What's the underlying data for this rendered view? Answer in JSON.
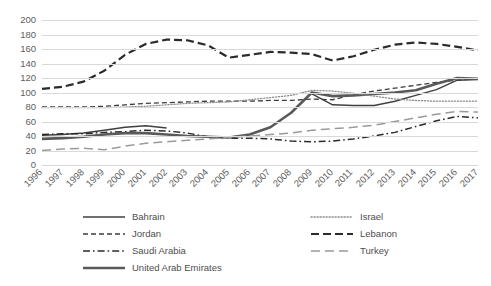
{
  "chart_data": {
    "type": "line",
    "title": "",
    "xlabel": "",
    "ylabel": "",
    "ylim": [
      0,
      200
    ],
    "ytick_step": 20,
    "grid": true,
    "legend_position": "bottom",
    "yticks": [
      "200",
      "180",
      "160",
      "140",
      "120",
      "100",
      "80",
      "60",
      "40",
      "20",
      "0"
    ],
    "categories": [
      "1996",
      "1997",
      "1998",
      "1999",
      "2000",
      "2001",
      "2002",
      "2003",
      "2004",
      "2005",
      "2006",
      "2007",
      "2008",
      "2009",
      "2010",
      "2011",
      "2012",
      "2013",
      "2014",
      "2015",
      "2016",
      "2017"
    ],
    "series": [
      {
        "name": "Bahrain",
        "style": "solid-thin",
        "color": "#404040",
        "values": [
          41,
          42,
          44,
          48,
          52,
          54,
          51,
          null,
          null,
          null,
          null,
          null,
          null,
          98,
          83,
          82,
          82,
          88,
          96,
          104,
          117,
          118
        ]
      },
      {
        "name": "Jordan",
        "style": "dashed",
        "color": "#3d3d3d",
        "values": [
          80,
          80,
          80,
          81,
          83,
          85,
          86,
          87,
          88,
          88,
          88,
          89,
          89,
          91,
          90,
          97,
          102,
          106,
          110,
          114,
          117,
          119
        ]
      },
      {
        "name": "Saudi Arabia",
        "style": "dash-dot",
        "color": "#2b2b2b",
        "values": [
          42,
          43,
          43,
          45,
          46,
          48,
          47,
          44,
          39,
          37,
          37,
          36,
          33,
          32,
          33,
          36,
          40,
          45,
          53,
          61,
          67,
          65
        ]
      },
      {
        "name": "United Arab Emirates",
        "style": "solid-thick",
        "color": "#595959",
        "values": [
          36,
          37,
          39,
          42,
          44,
          44,
          42,
          40,
          39,
          38,
          42,
          52,
          72,
          100,
          95,
          96,
          98,
          100,
          103,
          112,
          120,
          119
        ]
      },
      {
        "name": "Israel",
        "style": "dotted",
        "color": "#8c8c8c",
        "values": [
          79,
          79,
          79,
          79,
          80,
          81,
          83,
          85,
          86,
          87,
          90,
          93,
          96,
          103,
          102,
          99,
          95,
          91,
          89,
          88,
          88,
          88
        ]
      },
      {
        "name": "Lebanon",
        "style": "long-dash-bold",
        "color": "#2b2b2b",
        "values": [
          105,
          108,
          115,
          130,
          152,
          167,
          173,
          172,
          165,
          148,
          152,
          156,
          155,
          153,
          144,
          150,
          159,
          166,
          169,
          167,
          163,
          158
        ]
      },
      {
        "name": "Turkey",
        "style": "long-dash-gray",
        "color": "#9a9a9a",
        "values": [
          20,
          22,
          23,
          21,
          26,
          30,
          32,
          34,
          36,
          38,
          40,
          42,
          44,
          48,
          50,
          52,
          55,
          60,
          65,
          70,
          74,
          73
        ]
      }
    ]
  },
  "legend": {
    "items": [
      {
        "label": "Bahrain",
        "column": "left"
      },
      {
        "label": "Jordan",
        "column": "left"
      },
      {
        "label": "Saudi Arabia",
        "column": "left"
      },
      {
        "label": "United Arab Emirates",
        "column": "left"
      },
      {
        "label": "Israel",
        "column": "right"
      },
      {
        "label": "Lebanon",
        "column": "right"
      },
      {
        "label": "Turkey",
        "column": "right"
      }
    ]
  }
}
